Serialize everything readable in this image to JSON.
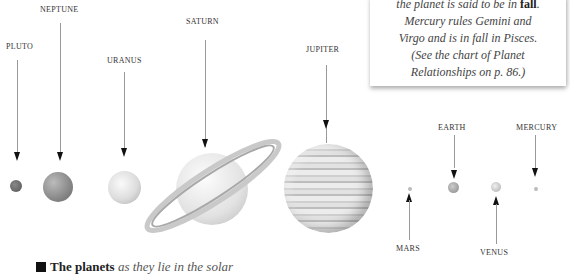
{
  "callout": {
    "line1_prefix": "the planet is said to be in ",
    "line1_bold": "fall",
    "line1_suffix": ".",
    "line2": "Mercury rules Gemini and",
    "line3": "Virgo and is in fall in Pisces.",
    "line4": "(See the chart of Planet",
    "line5": "Relationships on p. 86.)"
  },
  "planets": [
    {
      "name": "PLUTO",
      "arrow": "down"
    },
    {
      "name": "NEPTUNE",
      "arrow": "down"
    },
    {
      "name": "URANUS",
      "arrow": "down"
    },
    {
      "name": "SATURN",
      "arrow": "down"
    },
    {
      "name": "JUPITER",
      "arrow": "down"
    },
    {
      "name": "MARS",
      "arrow": "up"
    },
    {
      "name": "EARTH",
      "arrow": "down"
    },
    {
      "name": "VENUS",
      "arrow": "up"
    },
    {
      "name": "MERCURY",
      "arrow": "down"
    }
  ],
  "caption": {
    "bold": "The planets",
    "italic": " as they lie in the solar"
  }
}
